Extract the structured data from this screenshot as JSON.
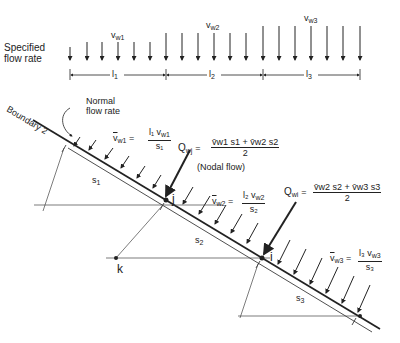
{
  "top": {
    "label": [
      "Specified",
      "flow rate"
    ],
    "segments": [
      {
        "vel": "v",
        "vel_sub": "w1",
        "len": "l",
        "len_sub": "1"
      },
      {
        "vel": "v",
        "vel_sub": "w2",
        "len": "l",
        "len_sub": "2"
      },
      {
        "vel": "v",
        "vel_sub": "w3",
        "len": "l",
        "len_sub": "3"
      }
    ]
  },
  "boundary": {
    "label": "Boundary 2",
    "normal_flow": [
      "Normal",
      "flow rate"
    ]
  },
  "equations": {
    "vw1": {
      "lhs": "v",
      "lhs_sub": "w1",
      "num": "l₁ v",
      "num_sub": "w1",
      "den": "s₁"
    },
    "vw2": {
      "lhs": "v",
      "lhs_sub": "w2",
      "num": "l₂ v",
      "num_sub": "w2",
      "den": "s₂"
    },
    "vw3": {
      "lhs": "v",
      "lhs_sub": "w3",
      "num": "l₃ v",
      "num_sub": "w3",
      "den": "s₃"
    },
    "qwj": {
      "lhs": "Q",
      "lhs_sub": "wj",
      "num": "v̄w1 s1 + v̄w2 s2",
      "den": "2",
      "note": "(Nodal flow)"
    },
    "qwi": {
      "lhs": "Q",
      "lhs_sub": "wi",
      "num": "v̄w2 s2 + v̄w3 s3",
      "den": "2"
    }
  },
  "dims": {
    "s1": "s",
    "s1_sub": "1",
    "s2": "s",
    "s2_sub": "2",
    "s3": "s",
    "s3_sub": "3"
  },
  "nodes": {
    "j": "j",
    "i": "i",
    "k": "k"
  },
  "eq": "="
}
